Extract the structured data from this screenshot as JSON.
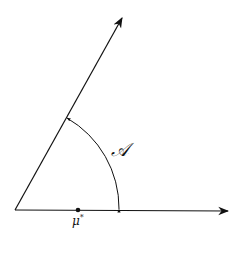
{
  "diagram": {
    "labels": {
      "angle": "𝒜",
      "point_symbol": "μ",
      "point_superscript": "*"
    },
    "colors": {
      "stroke": "#111111",
      "background": "#ffffff"
    }
  }
}
